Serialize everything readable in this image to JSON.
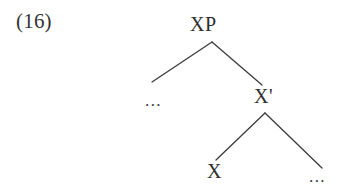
{
  "figure": {
    "example_number": "(16)",
    "type": "x-bar-syntax-tree",
    "background_color": "#ffffff",
    "text_color": "#2d2d2d",
    "line_color": "#3b3b3b"
  },
  "tree": {
    "root": {
      "label": "XP",
      "x": 212,
      "y": 28
    },
    "nodes": [
      {
        "id": "xp",
        "label": "XP",
        "x": 212,
        "y": 28,
        "role": "maximal-projection"
      },
      {
        "id": "spec",
        "label": "...",
        "x": 152,
        "y": 101,
        "role": "specifier-ellipsis"
      },
      {
        "id": "xbar",
        "label": "X'",
        "x": 265,
        "y": 97,
        "role": "intermediate-projection"
      },
      {
        "id": "head",
        "label": "X",
        "x": 214,
        "y": 171,
        "role": "head"
      },
      {
        "id": "comp",
        "label": "...",
        "x": 317,
        "y": 177,
        "role": "complement-ellipsis"
      }
    ],
    "branches": [
      {
        "from": "xp",
        "to": "spec",
        "x1": 212,
        "y1": 42,
        "x2": 152,
        "y2": 82
      },
      {
        "from": "xp",
        "to": "xbar",
        "x1": 212,
        "y1": 42,
        "x2": 262,
        "y2": 85
      },
      {
        "from": "xbar",
        "to": "head",
        "x1": 265,
        "y1": 113,
        "x2": 216,
        "y2": 160
      },
      {
        "from": "xbar",
        "to": "comp",
        "x1": 265,
        "y1": 113,
        "x2": 322,
        "y2": 168
      }
    ]
  }
}
